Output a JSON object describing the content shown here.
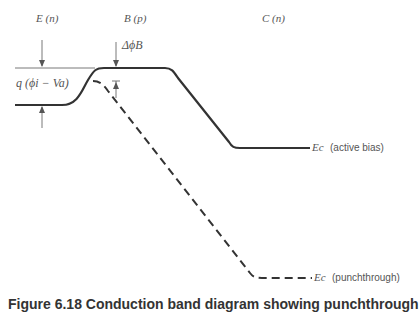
{
  "diagram": {
    "regions": {
      "emitter": "E (n)",
      "base": "B (p)",
      "collector": "C (n)"
    },
    "annotations": {
      "barrier_height": "q (ϕi − Va)",
      "barrier_lowering": "ΔϕB"
    },
    "curves": {
      "active_bias": {
        "symbol": "Ec",
        "label": "(active bias)",
        "style": "solid"
      },
      "punchthrough": {
        "symbol": "Ec",
        "label": "(punchthrough)",
        "style": "dashed"
      }
    },
    "colors": {
      "line": "#333333",
      "text": "#555555"
    }
  },
  "caption": {
    "text": "Figure 6.18   Conduction band diagram showing punchthrough"
  }
}
